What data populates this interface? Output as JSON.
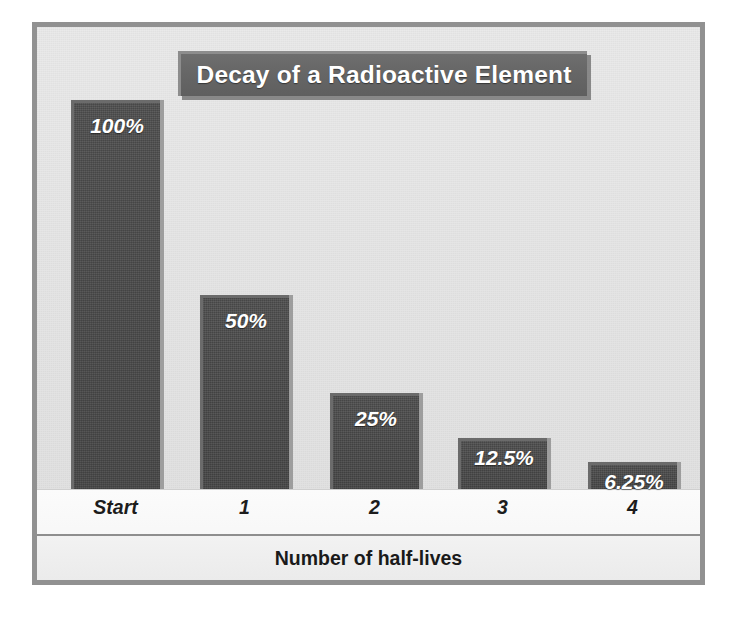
{
  "chart_data": {
    "type": "bar",
    "title": "Decay of a Radioactive Element",
    "xlabel": "Number of half-lives",
    "ylabel": "",
    "categories": [
      "Start",
      "1",
      "2",
      "3",
      "4"
    ],
    "values": [
      100,
      50,
      25,
      12.5,
      6.25
    ],
    "data_labels": [
      "100%",
      "50%",
      "25%",
      "12.5%",
      "6.25%"
    ],
    "ylim": [
      0,
      100
    ],
    "grid": false,
    "legend": "none",
    "colors": {
      "bar_fill": "#494949",
      "bar_highlight": "#6b6b6b",
      "bar_shadow": "#969696",
      "plot_background": "#e6e6e6",
      "frame_border": "#919191",
      "title_banner": "#676767",
      "title_text": "#ffffff",
      "axis_band": "#f4f4f4",
      "axis_rule": "#8e8e8e",
      "label_text": "#1c1c1c"
    },
    "bar_layout": [
      {
        "label": "Start",
        "value_label": "100%",
        "left": 34,
        "width": 89,
        "height": 390
      },
      {
        "label": "1",
        "value_label": "50%",
        "left": 163,
        "width": 89,
        "height": 195
      },
      {
        "label": "2",
        "value_label": "25%",
        "left": 293,
        "width": 89,
        "height": 97
      },
      {
        "label": "3",
        "value_label": "12.5%",
        "left": 421,
        "width": 89,
        "height": 52
      },
      {
        "label": "4",
        "value_label": "6.25%",
        "left": 551,
        "width": 89,
        "height": 28
      }
    ],
    "tick_layout": [
      {
        "label": "Start",
        "left": 34,
        "width": 89
      },
      {
        "label": "1",
        "left": 163,
        "width": 89
      },
      {
        "label": "2",
        "left": 293,
        "width": 89
      },
      {
        "label": "3",
        "left": 421,
        "width": 89
      },
      {
        "label": "4",
        "left": 551,
        "width": 89
      }
    ]
  }
}
